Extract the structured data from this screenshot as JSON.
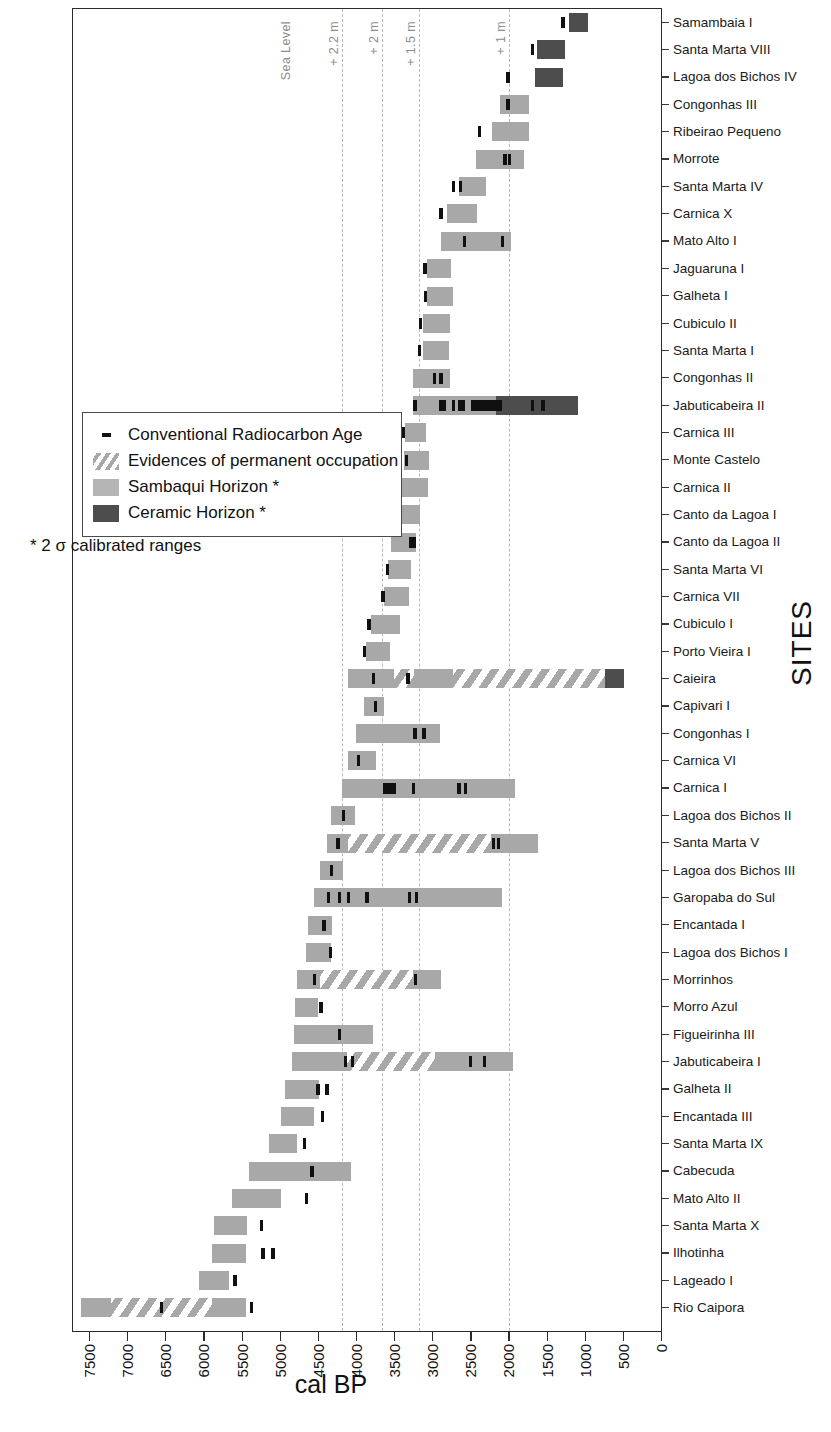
{
  "chart_data": {
    "type": "bar",
    "chart_kind": "horizontal ranged bar / gantt-style chronology chart",
    "title": "",
    "xlabel": "cal BP",
    "ylabel": "SITES",
    "xlim": [
      7500,
      0
    ],
    "x_reversed": true,
    "xticks": [
      7500,
      7000,
      6500,
      6000,
      5500,
      5000,
      4500,
      4000,
      3500,
      3000,
      2500,
      2000,
      1500,
      1000,
      500,
      0
    ],
    "grid": "vertical dashed reference lines only",
    "legend_position": "left-middle, inside plot area",
    "reference_lines": [
      {
        "label": "Sea Level",
        "cal_bp": 4830,
        "style": "label only, no line"
      },
      {
        "label": "+ 2.2 m",
        "cal_bp": 4195,
        "style": "dashed"
      },
      {
        "label": "+ 2 m",
        "cal_bp": 3670,
        "style": "dashed"
      },
      {
        "label": "+ 1.5 m",
        "cal_bp": 3185,
        "style": "dashed"
      },
      {
        "label": "+ 1 m",
        "cal_bp": 2005,
        "style": "dashed"
      }
    ],
    "legend": [
      {
        "key": "dot-marker",
        "label": "Conventional Radiocarbon Age"
      },
      {
        "key": "hatch-swatch",
        "label": "Evidences of permanent occupation"
      },
      {
        "key": "sambaqui-swatch",
        "label": "Sambaqui Horizon *"
      },
      {
        "key": "ceramic-swatch",
        "label": "Ceramic Horizon *"
      }
    ],
    "legend_note": "* 2 σ calibrated ranges",
    "colors": {
      "sambaqui": "#a8a8a8",
      "ceramic": "#4d4d4d",
      "hatch": "#a8a8a8",
      "marker": "#101010",
      "reference_line": "#b9b9b9",
      "frame": "#2b2b2b"
    },
    "categories": [
      "Samambaia I",
      "Santa Marta VIII",
      "Lagoa dos Bichos IV",
      "Congonhas III",
      "Ribeirao Pequeno",
      "Morrote",
      "Santa Marta IV",
      "Carnica X",
      "Mato Alto I",
      "Jaguaruna I",
      "Galheta I",
      "Cubiculo II",
      "Santa Marta I",
      "Congonhas II",
      "Jabuticabeira II",
      "Carnica III",
      "Monte Castelo",
      "Carnica II",
      "Canto da Lagoa I",
      "Canto da Lagoa II",
      "Santa Marta VI",
      "Carnica VII",
      "Cubiculo I",
      "Porto Vieira I",
      "Caieira",
      "Capivari I",
      "Congonhas I",
      "Carnica VI",
      "Carnica I",
      "Lagoa dos Bichos II",
      "Santa Marta V",
      "Lagoa dos Bichos III",
      "Garopaba do Sul",
      "Encantada I",
      "Lagoa dos Bichos I",
      "Morrinhos",
      "Morro Azul",
      "Figueirinha III",
      "Jabuticabeira I",
      "Galheta II",
      "Encantada III",
      "Santa Marta IX",
      "Cabecuda",
      "Mato Alto II",
      "Santa Marta X",
      "Ilhotinha",
      "Lageado I",
      "Rio Caipora"
    ],
    "rows": [
      {
        "site": "Samambaia I",
        "segments": [
          {
            "type": "ceramic",
            "from": 1220,
            "to": 970
          }
        ],
        "markers": [
          1300
        ]
      },
      {
        "site": "Santa Marta VIII",
        "segments": [
          {
            "type": "ceramic",
            "from": 1640,
            "to": 1270
          }
        ],
        "markers": [
          1700
        ]
      },
      {
        "site": "Lagoa dos Bichos IV",
        "segments": [
          {
            "type": "ceramic",
            "from": 1660,
            "to": 1300
          }
        ],
        "markers": [
          2020
        ]
      },
      {
        "site": "Congonhas III",
        "segments": [
          {
            "type": "sambaqui",
            "from": 2120,
            "to": 1740
          }
        ],
        "markers": [
          2020
        ]
      },
      {
        "site": "Ribeirao Pequeno",
        "segments": [
          {
            "type": "sambaqui",
            "from": 2230,
            "to": 1740
          }
        ],
        "markers": [
          2390
        ]
      },
      {
        "site": "Morrote",
        "segments": [
          {
            "type": "sambaqui",
            "from": 2440,
            "to": 1810
          }
        ],
        "markers": [
          2060,
          2000
        ]
      },
      {
        "site": "Santa Marta IV",
        "segments": [
          {
            "type": "sambaqui",
            "from": 2660,
            "to": 2310
          }
        ],
        "markers": [
          2730,
          2640
        ]
      },
      {
        "site": "Carnica X",
        "segments": [
          {
            "type": "sambaqui",
            "from": 2820,
            "to": 2430
          }
        ],
        "markers": [
          2900
        ]
      },
      {
        "site": "Mato Alto I",
        "segments": [
          {
            "type": "sambaqui",
            "from": 2900,
            "to": 1980
          }
        ],
        "markers": [
          2590,
          2090
        ]
      },
      {
        "site": "Jaguaruna I",
        "segments": [
          {
            "type": "sambaqui",
            "from": 3080,
            "to": 2760
          }
        ],
        "markers": [
          3110
        ]
      },
      {
        "site": "Galheta I",
        "segments": [
          {
            "type": "sambaqui",
            "from": 3080,
            "to": 2740
          }
        ],
        "markers": [
          3100
        ]
      },
      {
        "site": "Cubiculo II",
        "segments": [
          {
            "type": "sambaqui",
            "from": 3130,
            "to": 2780
          }
        ],
        "markers": [
          3170
        ]
      },
      {
        "site": "Santa Marta I",
        "segments": [
          {
            "type": "sambaqui",
            "from": 3140,
            "to": 2790
          }
        ],
        "markers": [
          3180
        ]
      },
      {
        "site": "Congonhas II",
        "segments": [
          {
            "type": "sambaqui",
            "from": 3270,
            "to": 2780
          }
        ],
        "markers": [
          2980,
          2900
        ]
      },
      {
        "site": "Jabuticabeira II",
        "segments": [
          {
            "type": "sambaqui",
            "from": 3270,
            "to": 2180
          },
          {
            "type": "ceramic",
            "from": 2180,
            "to": 1100
          }
        ],
        "markers": [
          3240,
          2900,
          2850,
          2730,
          2650,
          2600,
          2480,
          2440,
          2400,
          2360,
          2320,
          2280,
          2240,
          2200,
          2160,
          2120,
          1700,
          1560
        ]
      },
      {
        "site": "Carnica III",
        "segments": [
          {
            "type": "sambaqui",
            "from": 3370,
            "to": 3090
          }
        ],
        "markers": [
          3390
        ]
      },
      {
        "site": "Monte Castelo",
        "segments": [
          {
            "type": "sambaqui",
            "from": 3380,
            "to": 3060
          }
        ],
        "markers": [
          3350
        ]
      },
      {
        "site": "Carnica II",
        "segments": [
          {
            "type": "sambaqui",
            "from": 3420,
            "to": 3070
          }
        ],
        "markers": [
          3440
        ]
      },
      {
        "site": "Canto da Lagoa I",
        "segments": [
          {
            "type": "sambaqui",
            "from": 3470,
            "to": 3170
          }
        ],
        "markers": [
          3490
        ]
      },
      {
        "site": "Canto da Lagoa II",
        "segments": [
          {
            "type": "sambaqui",
            "from": 3550,
            "to": 3230
          }
        ],
        "markers": [
          3300,
          3250
        ]
      },
      {
        "site": "Santa Marta VI",
        "segments": [
          {
            "type": "sambaqui",
            "from": 3590,
            "to": 3290
          }
        ],
        "markers": [
          3600
        ]
      },
      {
        "site": "Carnica VII",
        "segments": [
          {
            "type": "sambaqui",
            "from": 3640,
            "to": 3320
          }
        ],
        "markers": [
          3660
        ]
      },
      {
        "site": "Cubiculo I",
        "segments": [
          {
            "type": "sambaqui",
            "from": 3810,
            "to": 3430
          }
        ],
        "markers": [
          3840
        ]
      },
      {
        "site": "Porto Vieira I",
        "segments": [
          {
            "type": "sambaqui",
            "from": 3880,
            "to": 3560
          }
        ],
        "markers": [
          3900
        ]
      },
      {
        "site": "Caieira",
        "segments": [
          {
            "type": "sambaqui",
            "from": 4120,
            "to": 3520
          },
          {
            "type": "hatch",
            "from": 3520,
            "to": 3250
          },
          {
            "type": "sambaqui",
            "from": 3250,
            "to": 2740
          },
          {
            "type": "hatch",
            "from": 2740,
            "to": 750
          },
          {
            "type": "ceramic",
            "from": 750,
            "to": 500
          }
        ],
        "markers": [
          3780,
          3330
        ]
      },
      {
        "site": "Capivari I",
        "segments": [
          {
            "type": "sambaqui",
            "from": 3910,
            "to": 3640
          }
        ],
        "markers": [
          3760
        ]
      },
      {
        "site": "Congonhas I",
        "segments": [
          {
            "type": "sambaqui",
            "from": 4010,
            "to": 2910
          }
        ],
        "markers": [
          3240,
          3120
        ]
      },
      {
        "site": "Carnica VI",
        "segments": [
          {
            "type": "sambaqui",
            "from": 4120,
            "to": 3750
          }
        ],
        "markers": [
          3980
        ]
      },
      {
        "site": "Carnica I",
        "segments": [
          {
            "type": "sambaqui",
            "from": 4190,
            "to": 1930
          }
        ],
        "markers": [
          3630,
          3590,
          3550,
          3510,
          3260,
          2660,
          2580
        ]
      },
      {
        "site": "Lagoa dos Bichos II",
        "segments": [
          {
            "type": "sambaqui",
            "from": 4340,
            "to": 4030
          }
        ],
        "markers": [
          4180
        ]
      },
      {
        "site": "Santa Marta V",
        "segments": [
          {
            "type": "sambaqui",
            "from": 4390,
            "to": 4120
          },
          {
            "type": "hatch",
            "from": 4120,
            "to": 2240
          },
          {
            "type": "sambaqui",
            "from": 2240,
            "to": 1620
          }
        ],
        "markers": [
          4250,
          2210,
          2140
        ]
      },
      {
        "site": "Lagoa dos Bichos III",
        "segments": [
          {
            "type": "sambaqui",
            "from": 4490,
            "to": 4180
          }
        ],
        "markers": [
          4330
        ]
      },
      {
        "site": "Garopaba do Sul",
        "segments": [
          {
            "type": "sambaqui",
            "from": 4560,
            "to": 2100
          }
        ],
        "markers": [
          4370,
          4230,
          4110,
          3870,
          3310,
          3220
        ]
      },
      {
        "site": "Encantada I",
        "segments": [
          {
            "type": "sambaqui",
            "from": 4640,
            "to": 4330
          }
        ],
        "markers": [
          4430
        ]
      },
      {
        "site": "Lagoa dos Bichos I",
        "segments": [
          {
            "type": "sambaqui",
            "from": 4670,
            "to": 4340
          }
        ],
        "markers": [
          4350
        ]
      },
      {
        "site": "Morrinhos",
        "segments": [
          {
            "type": "sambaqui",
            "from": 4790,
            "to": 4480
          },
          {
            "type": "hatch",
            "from": 4480,
            "to": 3270
          },
          {
            "type": "sambaqui",
            "from": 3270,
            "to": 2900
          }
        ],
        "markers": [
          4560,
          3230
        ]
      },
      {
        "site": "Morro Azul",
        "segments": [
          {
            "type": "sambaqui",
            "from": 4810,
            "to": 4510
          }
        ],
        "markers": [
          4470
        ]
      },
      {
        "site": "Figueirinha III",
        "segments": [
          {
            "type": "sambaqui",
            "from": 4830,
            "to": 3790
          }
        ],
        "markers": [
          4230
        ]
      },
      {
        "site": "Jabuticabeira I",
        "segments": [
          {
            "type": "sambaqui",
            "from": 4850,
            "to": 4130
          },
          {
            "type": "hatch",
            "from": 4130,
            "to": 2970
          },
          {
            "type": "sambaqui",
            "from": 2970,
            "to": 1950
          }
        ],
        "markers": [
          4150,
          4060,
          2510,
          2330
        ]
      },
      {
        "site": "Galheta II",
        "segments": [
          {
            "type": "sambaqui",
            "from": 4940,
            "to": 4500
          }
        ],
        "markers": [
          4510,
          4390
        ]
      },
      {
        "site": "Encantada III",
        "segments": [
          {
            "type": "sambaqui",
            "from": 5000,
            "to": 4560
          }
        ],
        "markers": [
          4450
        ]
      },
      {
        "site": "Santa Marta IX",
        "segments": [
          {
            "type": "sambaqui",
            "from": 5150,
            "to": 4790
          }
        ],
        "markers": [
          4690
        ]
      },
      {
        "site": "Cabecuda",
        "segments": [
          {
            "type": "sambaqui",
            "from": 5410,
            "to": 4080
          }
        ],
        "markers": [
          4590
        ]
      },
      {
        "site": "Mato Alto II",
        "segments": [
          {
            "type": "sambaqui",
            "from": 5640,
            "to": 5000
          }
        ],
        "markers": [
          4660
        ]
      },
      {
        "site": "Santa Marta X",
        "segments": [
          {
            "type": "sambaqui",
            "from": 5880,
            "to": 5440
          }
        ],
        "markers": [
          5250
        ]
      },
      {
        "site": "Ilhotinha",
        "segments": [
          {
            "type": "sambaqui",
            "from": 5900,
            "to": 5460
          }
        ],
        "markers": [
          5230,
          5100
        ]
      },
      {
        "site": "Lageado I",
        "segments": [
          {
            "type": "sambaqui",
            "from": 6070,
            "to": 5680
          }
        ],
        "markers": [
          5600
        ]
      },
      {
        "site": "Rio Caipora",
        "segments": [
          {
            "type": "sambaqui",
            "from": 7620,
            "to": 7230
          },
          {
            "type": "hatch",
            "from": 7230,
            "to": 5900
          },
          {
            "type": "sambaqui",
            "from": 5900,
            "to": 5460
          }
        ],
        "markers": [
          6560,
          5380
        ]
      }
    ]
  }
}
